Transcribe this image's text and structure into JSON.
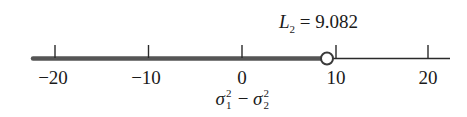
{
  "figure": {
    "annotation": {
      "symbol": "L",
      "subscript": "2",
      "equals": "=",
      "value": "9.082"
    },
    "axis": {
      "xlabel": {
        "term1": "σ",
        "term1_sup": "2",
        "term1_sub": "1",
        "operator": "−",
        "term2": "σ",
        "term2_sup": "2",
        "term2_sub": "2"
      },
      "ticks": [
        {
          "value": -20,
          "label": "−20"
        },
        {
          "value": -10,
          "label": "−10"
        },
        {
          "value": 0,
          "label": "0"
        },
        {
          "value": 10,
          "label": "10"
        },
        {
          "value": 20,
          "label": "20"
        }
      ],
      "range": [
        -22.5,
        22.5
      ]
    },
    "interval": {
      "type": "open-upper-bound",
      "shaded_from": "-infinity",
      "endpoint": 9.082,
      "endpoint_style": "open-circle"
    },
    "colors": {
      "line": "#2a2a2a",
      "shaded_line": "#555555",
      "text": "#1a1a1a",
      "background": "#ffffff"
    }
  }
}
